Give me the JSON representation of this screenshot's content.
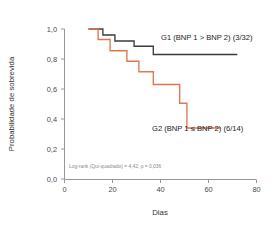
{
  "chart_data": {
    "type": "line",
    "title": "",
    "subtitle": "",
    "xlabel": "Dias",
    "ylabel": "Probabilidade de sobrevida",
    "xlim": [
      0,
      80
    ],
    "ylim": [
      0.0,
      1.0
    ],
    "xticks": [
      0,
      20,
      40,
      60,
      80
    ],
    "xtick_labels": [
      "0",
      "20",
      "40",
      "60",
      "80"
    ],
    "yticks": [
      0.0,
      0.2,
      0.4,
      0.6,
      0.8,
      1.0
    ],
    "ytick_labels": [
      "0,0",
      "0,2",
      "0,4",
      "0,6",
      "0,8",
      "1,0"
    ],
    "grid": false,
    "legend_position": "inline-annotation",
    "annotations": [
      {
        "name": "g1-series-label",
        "text": "G1 (BNP 1 > BNP 2) (3/32)",
        "x": 41,
        "y": 0.92
      },
      {
        "name": "g2-series-label",
        "text": "G2 (BNP 1 ≤ BNP 2) (6/14)",
        "x": 41,
        "y": 0.27
      },
      {
        "name": "logrank-statistic",
        "text": "Log-rank (Qui-quadrado) = 4,42; p = 0,036",
        "x": 3,
        "y": 0.055
      }
    ],
    "series": [
      {
        "name": "G1 (BNP 1 > BNP 2) (3/32)",
        "label": "G1 (BNP 1 > BNP 2) (3/32)",
        "events": "3/32",
        "color": "#3b3b3b",
        "x": [
          10,
          16,
          16,
          21,
          21,
          29,
          29,
          37,
          37,
          72
        ],
        "y": [
          1.0,
          1.0,
          0.96,
          0.96,
          0.92,
          0.92,
          0.885,
          0.885,
          0.83,
          0.83
        ],
        "steps": [
          {
            "day": 10,
            "survival": 1.0
          },
          {
            "day": 16,
            "survival": 0.96
          },
          {
            "day": 21,
            "survival": 0.92
          },
          {
            "day": 29,
            "survival": 0.885
          },
          {
            "day": 37,
            "survival": 0.83
          },
          {
            "day": 72,
            "survival": 0.83
          }
        ]
      },
      {
        "name": "G2 (BNP 1 ≤ BNP 2) (6/14)",
        "label": "G2 (BNP 1 ≤ BNP 2) (6/14)",
        "events": "6/14",
        "color": "#e0764f",
        "x": [
          10,
          14,
          14,
          19,
          19,
          26,
          26,
          31,
          31,
          37,
          37,
          48,
          48,
          51,
          51,
          65
        ],
        "y": [
          1.0,
          1.0,
          0.93,
          0.93,
          0.855,
          0.855,
          0.785,
          0.785,
          0.715,
          0.715,
          0.63,
          0.63,
          0.505,
          0.505,
          0.34,
          0.34
        ],
        "steps": [
          {
            "day": 10,
            "survival": 1.0
          },
          {
            "day": 14,
            "survival": 0.93
          },
          {
            "day": 19,
            "survival": 0.855
          },
          {
            "day": 26,
            "survival": 0.785
          },
          {
            "day": 31,
            "survival": 0.715
          },
          {
            "day": 37,
            "survival": 0.63
          },
          {
            "day": 48,
            "survival": 0.505
          },
          {
            "day": 51,
            "survival": 0.34
          },
          {
            "day": 65,
            "survival": 0.34
          }
        ]
      }
    ],
    "statistics": {
      "test": "Log-rank (Qui-quadrado)",
      "chi_square": "4,42",
      "p_value": "0,036",
      "full_text": "Log-rank (Qui-quadrado) = 4,42; p = 0,036"
    },
    "colors": {
      "g1": "#3b3b3b",
      "g2": "#e0764f",
      "axis": "#8b8b8b",
      "tick_text": "#4a4a4a",
      "annotation_text": "#1c1c1c",
      "stat_text": "#8a8a8a",
      "background": "#ffffff"
    }
  }
}
